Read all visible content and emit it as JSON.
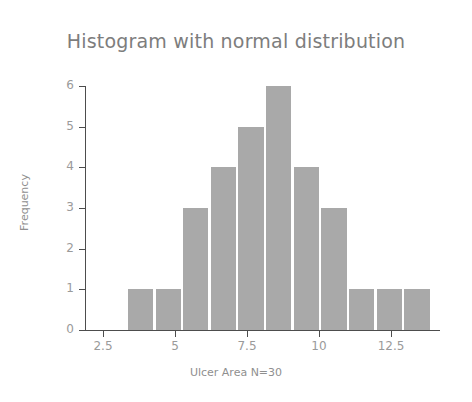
{
  "chart_data": {
    "type": "bar",
    "title": "Histogram with normal distribution",
    "xlabel": "Ulcer Area N=30",
    "ylabel": "Frequency",
    "categories": [
      "3.33",
      "4.29",
      "5.25",
      "6.21",
      "7.17",
      "8.13",
      "9.09",
      "10.05",
      "11.01",
      "11.97",
      "12.93"
    ],
    "bin_edges": [
      3.33,
      4.29,
      5.25,
      6.21,
      7.17,
      8.13,
      9.09,
      10.05,
      11.01,
      11.97,
      12.93,
      13.89
    ],
    "bin_centers": [
      3.81,
      4.77,
      5.73,
      6.69,
      7.65,
      8.61,
      9.57,
      10.53,
      11.49,
      12.45,
      13.41
    ],
    "values": [
      1,
      1,
      3,
      4,
      5,
      6,
      4,
      3,
      1,
      1,
      1
    ],
    "n": 30,
    "xlim": [
      2.0,
      14.3
    ],
    "ylim": [
      0,
      6
    ],
    "xticks": [
      2.5,
      5,
      7.5,
      10,
      12.5
    ],
    "xtick_labels": [
      "2.5",
      "5",
      "7.5",
      "10",
      "12.5"
    ],
    "yticks": [
      0,
      1,
      2,
      3,
      4,
      5,
      6
    ],
    "ytick_labels": [
      "0",
      "1",
      "2",
      "3",
      "4",
      "5",
      "6"
    ],
    "grid": false,
    "legend": null,
    "bar_color": "#a9a9a9",
    "axis_color": "#4d4d4d",
    "text_color": "#8f8f8f",
    "background": "#ffffff"
  }
}
